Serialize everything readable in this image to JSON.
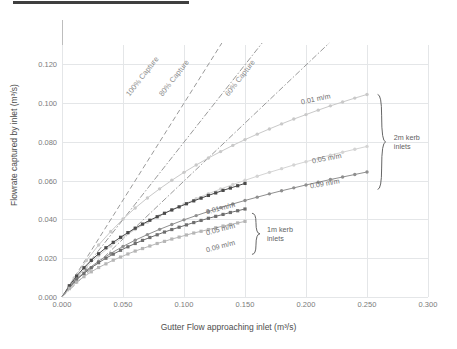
{
  "decor": {
    "top_rule": "title-underline-rule"
  },
  "chart_data": {
    "type": "line",
    "title": "",
    "xlabel": "Gutter Flow approaching inlet (m³/s)",
    "ylabel": "Flowrate captured by inlet (m³/s)",
    "xlim": [
      0.0,
      0.3
    ],
    "ylim": [
      0.0,
      0.13
    ],
    "xticks": [
      0.0,
      0.05,
      0.1,
      0.15,
      0.2,
      0.25,
      0.3
    ],
    "xtick_labels": [
      "0.000",
      "0.050",
      "0.100",
      "0.150",
      "0.200",
      "0.250",
      "0.300"
    ],
    "yticks": [
      0.0,
      0.02,
      0.04,
      0.06,
      0.08,
      0.1,
      0.12
    ],
    "ytick_labels": [
      "0.000",
      "0.020",
      "0.040",
      "0.060",
      "0.080",
      "0.100",
      "0.120"
    ],
    "grid": true,
    "legend": "inline-annotations",
    "reference_lines": [
      {
        "name": "100% Capture",
        "label": "100% Capture",
        "ratio": 1.0,
        "style": "dashed",
        "color": "#9a9a9a",
        "x": [
          0.0,
          0.131
        ],
        "y": [
          0.0,
          0.131
        ],
        "label_x": 0.0565,
        "label_y": 0.1075,
        "label_angle": -52
      },
      {
        "name": "80% Capture",
        "label": "80% Capture",
        "ratio": 0.8,
        "style": "dashdot",
        "color": "#9a9a9a",
        "x": [
          0.0,
          0.164
        ],
        "y": [
          0.0,
          0.131
        ],
        "label_x": 0.0835,
        "label_y": 0.1075,
        "label_angle": -52
      },
      {
        "name": "60% Capture",
        "label": "60% Capture",
        "ratio": 0.6,
        "style": "dashdot",
        "color": "#9a9a9a",
        "x": [
          0.0,
          0.219
        ],
        "y": [
          0.0,
          0.131
        ],
        "label_x": 0.1375,
        "label_y": 0.1075,
        "label_angle": -52
      }
    ],
    "x_2m": [
      0.0,
      0.01,
      0.02,
      0.03,
      0.04,
      0.05,
      0.06,
      0.07,
      0.08,
      0.09,
      0.1,
      0.11,
      0.12,
      0.13,
      0.14,
      0.15,
      0.16,
      0.17,
      0.18,
      0.19,
      0.2,
      0.21,
      0.22,
      0.23,
      0.24,
      0.25
    ],
    "x_1m": [
      0.0,
      0.006,
      0.012,
      0.018,
      0.024,
      0.03,
      0.036,
      0.042,
      0.048,
      0.054,
      0.06,
      0.066,
      0.072,
      0.078,
      0.084,
      0.09,
      0.096,
      0.102,
      0.108,
      0.114,
      0.12,
      0.126,
      0.132,
      0.138,
      0.144,
      0.15
    ],
    "series": [
      {
        "name": "2m kerb inlets, 0.01 m/m",
        "group": "2m kerb inlets",
        "label": "0.01 m/m",
        "slope": "0.01 m/m",
        "color": "#c9c9c9",
        "marker": "circle",
        "x_key": "x_2m",
        "values": [
          0.0,
          0.0098,
          0.0188,
          0.0268,
          0.0338,
          0.0402,
          0.0459,
          0.0511,
          0.0558,
          0.0602,
          0.0643,
          0.0681,
          0.0717,
          0.075,
          0.0782,
          0.0812,
          0.084,
          0.0867,
          0.0893,
          0.0918,
          0.0941,
          0.0964,
          0.0986,
          0.1006,
          0.1026,
          0.1045
        ],
        "label_x": 0.196,
        "label_y": 0.1005,
        "label_angle": -12
      },
      {
        "name": "2m kerb inlets, 0.05 m/m",
        "group": "2m kerb inlets",
        "label": "0.05 m/m",
        "slope": "0.05 m/m",
        "color": "#d4d4d4",
        "marker": "circle",
        "x_key": "x_2m",
        "values": [
          0.0,
          0.0086,
          0.0155,
          0.0213,
          0.0263,
          0.0308,
          0.0348,
          0.0385,
          0.0419,
          0.045,
          0.0479,
          0.0507,
          0.0533,
          0.0557,
          0.058,
          0.0602,
          0.0623,
          0.0643,
          0.0662,
          0.0681,
          0.0698,
          0.0715,
          0.0732,
          0.0747,
          0.0762,
          0.0777
        ]
      },
      {
        "name": "2m kerb inlets, 0.09 m/m",
        "group": "2m kerb inlets",
        "label": "0.09 m/m",
        "slope": "0.09 m/m",
        "color": "#8f8f8f",
        "marker": "circle",
        "x_key": "x_2m",
        "values": [
          0.0,
          0.0079,
          0.0138,
          0.0185,
          0.0225,
          0.0261,
          0.0293,
          0.0322,
          0.0349,
          0.0374,
          0.0398,
          0.042,
          0.0441,
          0.0461,
          0.048,
          0.0498,
          0.0515,
          0.0532,
          0.0548,
          0.0563,
          0.0578,
          0.0592,
          0.0606,
          0.0619,
          0.0632,
          0.0645
        ]
      },
      {
        "name": "1m kerb inlets, 0.01 m/m",
        "group": "1m kerb inlets",
        "label": "0.01 m/m",
        "slope": "0.01 m/m",
        "color": "#4a4a4a",
        "marker": "square",
        "x_key": "x_1m",
        "values": [
          0.0,
          0.0058,
          0.0108,
          0.0151,
          0.0189,
          0.0223,
          0.0254,
          0.0282,
          0.0308,
          0.0332,
          0.0355,
          0.0376,
          0.0396,
          0.0414,
          0.0432,
          0.0449,
          0.0465,
          0.0481,
          0.0496,
          0.051,
          0.0524,
          0.0537,
          0.055,
          0.0562,
          0.0574,
          0.0586
        ],
        "label_x": 0.118,
        "label_y": 0.0438,
        "label_angle": -15
      },
      {
        "name": "1m kerb inlets, 0.05 m/m",
        "group": "1m kerb inlets",
        "label": "0.05 m/m",
        "slope": "0.05 m/m",
        "color": "#6e6e6e",
        "marker": "square",
        "x_key": "x_1m",
        "values": [
          0.0,
          0.0049,
          0.0089,
          0.0122,
          0.0151,
          0.0177,
          0.02,
          0.0221,
          0.0241,
          0.0259,
          0.0276,
          0.0292,
          0.0307,
          0.0321,
          0.0335,
          0.0348,
          0.036,
          0.0372,
          0.0384,
          0.0395,
          0.0406,
          0.0416,
          0.0426,
          0.0436,
          0.0445,
          0.0454
        ],
        "label_x": 0.118,
        "label_y": 0.033,
        "label_angle": -15
      },
      {
        "name": "1m kerb inlets, 0.09 m/m",
        "group": "1m kerb inlets",
        "label": "0.09 m/m",
        "slope": "0.09 m/m",
        "color": "#b6b6b6",
        "marker": "square",
        "x_key": "x_1m",
        "values": [
          0.0,
          0.0043,
          0.0077,
          0.0105,
          0.013,
          0.0152,
          0.0171,
          0.019,
          0.0206,
          0.0222,
          0.0237,
          0.025,
          0.0263,
          0.0276,
          0.0287,
          0.0299,
          0.0309,
          0.032,
          0.033,
          0.0339,
          0.0348,
          0.0357,
          0.0366,
          0.0374,
          0.0382,
          0.039
        ],
        "label_x": 0.118,
        "label_y": 0.0245,
        "label_angle": -15
      }
    ],
    "group_brackets": [
      {
        "name": "2m kerb inlets",
        "label_line1": "2m kerb",
        "label_line2": "inlets",
        "x": 0.262,
        "y_top": 0.1045,
        "y_bottom": 0.0555,
        "label_x": 0.272,
        "label_y": 0.08
      },
      {
        "name": "1m kerb inlets",
        "label_line1": "1m kerb",
        "label_line2": "inlets",
        "x": 0.159,
        "y_top": 0.0432,
        "y_bottom": 0.022,
        "label_x": 0.168,
        "label_y": 0.0326
      }
    ]
  }
}
